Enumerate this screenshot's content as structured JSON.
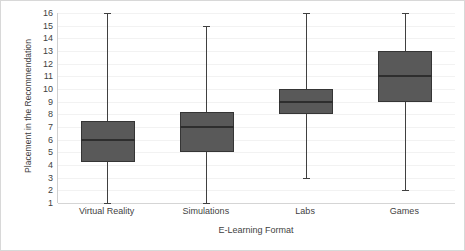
{
  "chart_data": {
    "type": "box",
    "title": "",
    "xlabel": "E-Learning Format",
    "ylabel": "Placement in the Recommendation",
    "categories": [
      "Virtual Reality",
      "Simulations",
      "Labs",
      "Games"
    ],
    "ylim": [
      1,
      16
    ],
    "y_ticks": [
      16,
      15,
      14,
      13,
      12,
      11,
      10,
      9,
      8,
      7,
      6,
      5,
      4,
      3,
      2,
      1
    ],
    "grid": true,
    "grid_orientation": "horizontal",
    "legend": "none",
    "box_fill_color": "#595959",
    "box_border_color": "#353535",
    "whisker_color": "#404040",
    "median_color": "#2e2e2e",
    "gridline_color": "#f2f2f2",
    "axis_color": "#d0d0d0",
    "text_color": "#3f3f3f",
    "background_color": "#ffffff",
    "boxes": [
      {
        "category": "Virtual Reality",
        "min": 1,
        "q1": 4.2,
        "median": 6,
        "q3": 7.5,
        "max": 16
      },
      {
        "category": "Simulations",
        "min": 1,
        "q1": 5,
        "median": 7,
        "q3": 8.2,
        "max": 15
      },
      {
        "category": "Labs",
        "min": 3,
        "q1": 8,
        "median": 9,
        "q3": 10,
        "max": 16
      },
      {
        "category": "Games",
        "min": 2,
        "q1": 9,
        "median": 11,
        "q3": 13,
        "max": 16
      }
    ]
  }
}
